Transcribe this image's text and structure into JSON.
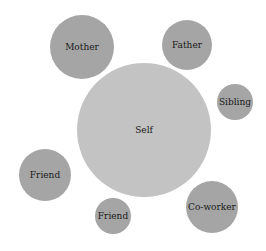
{
  "diagram": {
    "title": "",
    "type": "social network circles",
    "colors": {
      "outer": "#a5a5a5",
      "center": "#c3c3c3",
      "text": "#1a1a1a",
      "background": "#ffffff"
    },
    "nodes": [
      {
        "id": "mother",
        "label": "Mother",
        "cx": 82,
        "cy": 47,
        "r": 32,
        "color": "#a5a5a5"
      },
      {
        "id": "father",
        "label": "Father",
        "cx": 187,
        "cy": 45,
        "r": 25,
        "color": "#a5a5a5"
      },
      {
        "id": "sibling",
        "label": "Sibling",
        "cx": 235,
        "cy": 102,
        "r": 18,
        "color": "#a5a5a5"
      },
      {
        "id": "self",
        "label": "Self",
        "cx": 144,
        "cy": 130,
        "r": 67,
        "color": "#c3c3c3"
      },
      {
        "id": "friend-1",
        "label": "Friend",
        "cx": 45,
        "cy": 175,
        "r": 26,
        "color": "#a5a5a5"
      },
      {
        "id": "friend-2",
        "label": "Friend",
        "cx": 113,
        "cy": 216,
        "r": 18,
        "color": "#a5a5a5"
      },
      {
        "id": "coworker",
        "label": "Co-worker",
        "cx": 212,
        "cy": 207,
        "r": 26,
        "color": "#a5a5a5"
      }
    ]
  }
}
